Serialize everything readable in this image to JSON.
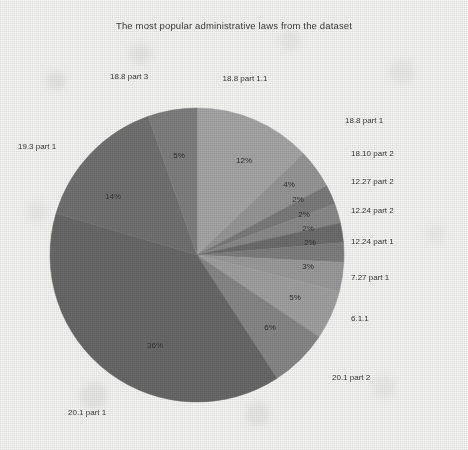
{
  "chart_data": {
    "type": "pie",
    "title": "The most popular administrative laws from the dataset",
    "xlabel": "",
    "ylabel": "",
    "legend_position": "none",
    "grid": false,
    "start_angle_deg": 90,
    "direction": "clockwise",
    "autopct": "%d%%",
    "categories": [
      "18.8 part 1.1",
      "18.8 part 1",
      "18.10 part 2",
      "12.27 part 2",
      "12.24 part 2",
      "12.24 part 1",
      "7.27 part 1",
      "6.1.1",
      "20.1 part 2",
      "20.1 part 1",
      "19.3 part 1",
      "18.8 part 3"
    ],
    "values": [
      12,
      4,
      2,
      2,
      2,
      2,
      3,
      5,
      6,
      36,
      14,
      5
    ],
    "pct_labels": [
      "12%",
      "4%",
      "2%",
      "2%",
      "2%",
      "2%",
      "3%",
      "5%",
      "6%",
      "36%",
      "14%",
      "5%"
    ],
    "colors": [
      "#a9a9a9",
      "#9a9a9a",
      "#7e7e7e",
      "#8d8d8d",
      "#6f6f6f",
      "#828282",
      "#9e9e9e",
      "#a4a4a4",
      "#8a8a8a",
      "#6b6b6b",
      "#747474",
      "#828282"
    ]
  },
  "slices": [
    {
      "label": "18.8 part 1.1",
      "pct": "12%",
      "value": 12,
      "color": "#a9a9a9",
      "pct_x": 244,
      "pct_y": 160,
      "cat_x": 245,
      "cat_y": 78,
      "cat_anchor": "mid"
    },
    {
      "label": "18.8 part 1",
      "pct": "4%",
      "value": 4,
      "color": "#9a9a9a",
      "pct_x": 289,
      "pct_y": 184,
      "cat_x": 345,
      "cat_y": 120,
      "cat_anchor": "start"
    },
    {
      "label": "18.10 part 2",
      "pct": "2%",
      "value": 2,
      "color": "#7e7e7e",
      "pct_x": 298,
      "pct_y": 199,
      "cat_x": 351,
      "cat_y": 153,
      "cat_anchor": "start"
    },
    {
      "label": "12.27 part 2",
      "pct": "2%",
      "value": 2,
      "color": "#8d8d8d",
      "pct_x": 304,
      "pct_y": 214,
      "cat_x": 351,
      "cat_y": 181,
      "cat_anchor": "start"
    },
    {
      "label": "12.24 part 2",
      "pct": "2%",
      "value": 2,
      "color": "#6f6f6f",
      "pct_x": 308,
      "pct_y": 228,
      "cat_x": 351,
      "cat_y": 210,
      "cat_anchor": "start"
    },
    {
      "label": "12.24 part 1",
      "pct": "2%",
      "value": 2,
      "color": "#828282",
      "pct_x": 310,
      "pct_y": 242,
      "cat_x": 351,
      "cat_y": 241,
      "cat_anchor": "start"
    },
    {
      "label": "7.27 part 1",
      "pct": "3%",
      "value": 3,
      "color": "#9e9e9e",
      "pct_x": 308,
      "pct_y": 266,
      "cat_x": 351,
      "cat_y": 277,
      "cat_anchor": "start"
    },
    {
      "label": "6.1.1",
      "pct": "5%",
      "value": 5,
      "color": "#a4a4a4",
      "pct_x": 295,
      "pct_y": 297,
      "cat_x": 351,
      "cat_y": 318,
      "cat_anchor": "start"
    },
    {
      "label": "20.1 part 2",
      "pct": "6%",
      "value": 6,
      "color": "#8a8a8a",
      "pct_x": 270,
      "pct_y": 327,
      "cat_x": 332,
      "cat_y": 377,
      "cat_anchor": "start"
    },
    {
      "label": "20.1 part 1",
      "pct": "36%",
      "value": 36,
      "color": "#6b6b6b",
      "pct_x": 155,
      "pct_y": 345,
      "cat_x": 68,
      "cat_y": 412,
      "cat_anchor": "start"
    },
    {
      "label": "19.3 part 1",
      "pct": "14%",
      "value": 14,
      "color": "#747474",
      "pct_x": 113,
      "pct_y": 196,
      "cat_x": 18,
      "cat_y": 146,
      "cat_anchor": "start"
    },
    {
      "label": "18.8 part 3",
      "pct": "5%",
      "value": 5,
      "color": "#828282",
      "pct_x": 179,
      "pct_y": 155,
      "cat_x": 110,
      "cat_y": 76,
      "cat_anchor": "start"
    }
  ],
  "geometry": {
    "cx": 197,
    "cy": 255,
    "r": 147,
    "pct_radius_ratio": 0.62
  }
}
